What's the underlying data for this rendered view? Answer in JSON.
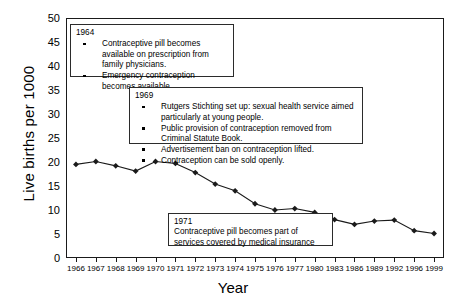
{
  "chart_data": {
    "type": "line",
    "title": "",
    "xlabel": "Year",
    "ylabel": "Live births per 1000",
    "ylim": [
      0,
      50
    ],
    "ytick_step": 5,
    "yticks": [
      50,
      45,
      40,
      35,
      30,
      25,
      20,
      15,
      10,
      5,
      0
    ],
    "grid": false,
    "legend": "none",
    "marker": "diamond",
    "line_color": "#1a1a1a",
    "categories": [
      "1966",
      "1967",
      "1968",
      "1969",
      "1970",
      "1971",
      "1972",
      "1973",
      "1974",
      "1975",
      "1976",
      "1977",
      "1980",
      "1983",
      "1986",
      "1989",
      "1992",
      "1996",
      "1999"
    ],
    "values": [
      19.5,
      20.1,
      19.2,
      18.1,
      20.1,
      19.7,
      17.8,
      15.4,
      14.0,
      11.3,
      10.0,
      10.3,
      9.5,
      8.0,
      7.0,
      7.7,
      7.9,
      5.7,
      5.1
    ],
    "annotations": [
      {
        "year": "1964",
        "bullets": [
          "Contraceptive pill becomes available on prescription from family physicians.",
          "Emergency contraception becomes available."
        ]
      },
      {
        "year": "1969",
        "bullets": [
          "Rutgers Stichting set up: sexual health service aimed particularly at young people.",
          "Public provision of contraception removed from Criminal Statute Book.",
          "Advertisement ban on contraception lifted.",
          "Contraception can be sold openly."
        ]
      },
      {
        "year": "1971",
        "text": "Contraceptive pill becomes part of services covered by medical insurance"
      }
    ]
  }
}
